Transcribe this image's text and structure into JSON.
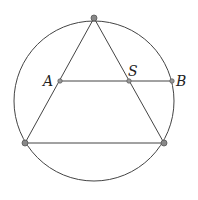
{
  "diagram": {
    "type": "geometry",
    "circle": {
      "cx": 94,
      "cy": 101,
      "r": 80
    },
    "vertices": {
      "top": {
        "x": 94,
        "y": 18
      },
      "bottom_left": {
        "x": 25,
        "y": 143
      },
      "bottom_right": {
        "x": 164,
        "y": 143
      }
    },
    "points": {
      "A": {
        "x": 60,
        "y": 81,
        "label": "A"
      },
      "S": {
        "x": 129,
        "y": 81,
        "label": "S"
      },
      "B": {
        "x": 172,
        "y": 81,
        "label": "B"
      }
    },
    "colors": {
      "stroke": "#444444",
      "point_fill": "#888888"
    }
  }
}
